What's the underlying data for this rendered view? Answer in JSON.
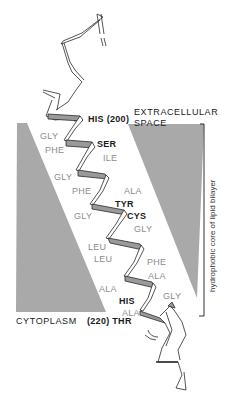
{
  "figure": {
    "regions": {
      "extracellular_line1": "EXTRACELLULAR",
      "extracellular_line2": "SPACE",
      "cytoplasm": "CYTOPLASM",
      "bilayer_bracket_label": "hydrophobic core of lipid bilayer"
    },
    "residues": [
      {
        "id": "his200",
        "label": "HIS (200)",
        "style": "dark"
      },
      {
        "id": "gly1",
        "label": "GLY",
        "style": "light"
      },
      {
        "id": "ser",
        "label": "SER",
        "style": "dark"
      },
      {
        "id": "phe1",
        "label": "PHE",
        "style": "light"
      },
      {
        "id": "ile",
        "label": "ILE",
        "style": "light"
      },
      {
        "id": "gly2",
        "label": "GLY",
        "style": "light"
      },
      {
        "id": "phe2",
        "label": "PHE",
        "style": "light"
      },
      {
        "id": "ala1",
        "label": "ALA",
        "style": "light"
      },
      {
        "id": "tyr",
        "label": "TYR",
        "style": "dark"
      },
      {
        "id": "gly3",
        "label": "GLY",
        "style": "light"
      },
      {
        "id": "cys",
        "label": "CYS",
        "style": "dark"
      },
      {
        "id": "gly4",
        "label": "GLY",
        "style": "light"
      },
      {
        "id": "leu1",
        "label": "LEU",
        "style": "light"
      },
      {
        "id": "leu2",
        "label": "LEU",
        "style": "light"
      },
      {
        "id": "phe3",
        "label": "PHE",
        "style": "light"
      },
      {
        "id": "ala2",
        "label": "ALA",
        "style": "light"
      },
      {
        "id": "ala3",
        "label": "ALA",
        "style": "light"
      },
      {
        "id": "gly5",
        "label": "GLY",
        "style": "light"
      },
      {
        "id": "his",
        "label": "HIS",
        "style": "dark"
      },
      {
        "id": "ala4",
        "label": "ALA",
        "style": "light"
      },
      {
        "id": "thr220",
        "label": "(220) THR",
        "style": "dark"
      }
    ],
    "colors": {
      "bilayer_shading": "#a9a9a9",
      "ribbon_outline": "#2a2a2a",
      "ribbon_shaded": "#9a9a9a",
      "label_dark": "#1a1a1a",
      "label_light": "#8c8c8c"
    }
  }
}
